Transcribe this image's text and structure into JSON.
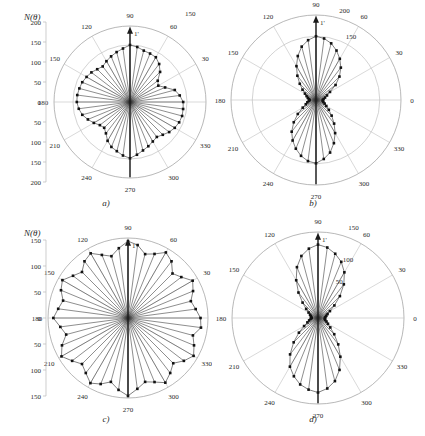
{
  "figure": {
    "background": "#ffffff",
    "panels": [
      {
        "id": "a",
        "caption": "a)",
        "axis_title": "N(θ)",
        "vertical_axis_ticks": [
          "200",
          "150",
          "100",
          "50",
          "0",
          "50",
          "100",
          "150",
          "200"
        ],
        "angle_labels": [
          "0",
          "30",
          "60",
          "90",
          "120",
          "150",
          "180",
          "210",
          "240",
          "270",
          "300",
          "330"
        ],
        "radial_labels": [
          "150"
        ],
        "mean_vector_label": "1'",
        "chart_data": {
          "type": "polar_rose",
          "title": "a)",
          "ylabel": "N(θ)",
          "theta_step_deg": 7.5,
          "rmax": 200,
          "rings": [
            150,
            200
          ],
          "theta": [
            0,
            7.5,
            15,
            22.5,
            30,
            37.5,
            45,
            52.5,
            60,
            67.5,
            75,
            82.5,
            90,
            97.5,
            105,
            112.5,
            120,
            127.5,
            135,
            142.5,
            150,
            157.5,
            165,
            172.5,
            180,
            187.5,
            195,
            202.5,
            210,
            217.5,
            225,
            232.5,
            240,
            247.5,
            255,
            262.5,
            270,
            277.5,
            285,
            292.5,
            300,
            307.5,
            315,
            322.5,
            330,
            337.5,
            345,
            352.5
          ],
          "values": [
            140,
            132,
            122,
            100,
            86,
            92,
            112,
            126,
            136,
            138,
            140,
            146,
            150,
            142,
            136,
            130,
            124,
            118,
            122,
            128,
            132,
            136,
            138,
            140,
            140,
            136,
            130,
            120,
            110,
            100,
            96,
            104,
            118,
            128,
            134,
            142,
            148,
            140,
            132,
            126,
            120,
            116,
            122,
            130,
            136,
            140,
            142,
            141
          ],
          "legend": [],
          "grid": true
        }
      },
      {
        "id": "b",
        "caption": "b)",
        "axis_title": "",
        "vertical_axis_ticks": [],
        "angle_labels": [
          "0",
          "30",
          "60",
          "90",
          "120",
          "150",
          "180",
          "210",
          "240",
          "270",
          "300",
          "330"
        ],
        "radial_labels": [
          "200",
          "150"
        ],
        "mean_vector_label": "1'",
        "chart_data": {
          "type": "polar_rose",
          "title": "b)",
          "ylabel": "N(θ)",
          "theta_step_deg": 7.5,
          "rmax": 200,
          "rings": [
            150,
            200
          ],
          "theta": [
            0,
            7.5,
            15,
            22.5,
            30,
            37.5,
            45,
            52.5,
            60,
            67.5,
            75,
            82.5,
            90,
            97.5,
            105,
            112.5,
            120,
            127.5,
            135,
            142.5,
            150,
            157.5,
            165,
            172.5,
            180,
            187.5,
            195,
            202.5,
            210,
            217.5,
            225,
            232.5,
            240,
            247.5,
            255,
            262.5,
            270,
            277.5,
            285,
            292.5,
            300,
            307.5,
            315,
            322.5,
            330,
            337.5,
            345,
            352.5
          ],
          "values": [
            16,
            18,
            22,
            28,
            38,
            58,
            78,
            96,
            112,
            126,
            138,
            146,
            150,
            142,
            130,
            112,
            92,
            72,
            54,
            40,
            30,
            24,
            20,
            17,
            15,
            17,
            21,
            26,
            36,
            54,
            74,
            94,
            110,
            124,
            136,
            145,
            149,
            140,
            128,
            110,
            90,
            70,
            52,
            38,
            28,
            22,
            18,
            16
          ],
          "legend": [],
          "grid": true
        }
      },
      {
        "id": "c",
        "caption": "c)",
        "axis_title": "N(θ)",
        "vertical_axis_ticks": [
          "150",
          "100",
          "50",
          "0",
          "50",
          "100",
          "150"
        ],
        "angle_labels": [
          "0",
          "30",
          "60",
          "90",
          "120",
          "150",
          "180",
          "210",
          "240",
          "270",
          "300",
          "330"
        ],
        "radial_labels": [],
        "mean_vector_label": "1'",
        "chart_data": {
          "type": "polar_rose",
          "title": "c)",
          "ylabel": "N(θ)",
          "theta_step_deg": 7.5,
          "rmax": 150,
          "rings": [
            150
          ],
          "theta": [
            0,
            7.5,
            15,
            22.5,
            30,
            37.5,
            45,
            52.5,
            60,
            67.5,
            75,
            82.5,
            90,
            97.5,
            105,
            112.5,
            120,
            127.5,
            135,
            142.5,
            150,
            157.5,
            165,
            172.5,
            180,
            187.5,
            195,
            202.5,
            210,
            217.5,
            225,
            232.5,
            240,
            247.5,
            255,
            262.5,
            270,
            277.5,
            285,
            292.5,
            300,
            307.5,
            315,
            322.5,
            330,
            337.5,
            345,
            352.5
          ],
          "values": [
            136,
            128,
            122,
            132,
            140,
            126,
            118,
            134,
            142,
            130,
            124,
            138,
            144,
            132,
            120,
            128,
            140,
            134,
            122,
            130,
            142,
            136,
            126,
            132,
            140,
            128,
            120,
            134,
            144,
            132,
            122,
            130,
            141,
            134,
            124,
            136,
            146,
            134,
            124,
            130,
            140,
            130,
            120,
            132,
            142,
            134,
            126,
            138
          ],
          "legend": [],
          "grid": true
        }
      },
      {
        "id": "d",
        "caption": "d)",
        "axis_title": "",
        "vertical_axis_ticks": [],
        "angle_labels": [
          "0",
          "30",
          "60",
          "90",
          "120",
          "150",
          "180",
          "210",
          "240",
          "270",
          "300",
          "330"
        ],
        "radial_labels": [
          "150",
          "100",
          "50"
        ],
        "mean_vector_label": "1'",
        "chart_data": {
          "type": "polar_rose",
          "title": "d)",
          "ylabel": "N(θ)",
          "theta_step_deg": 7.5,
          "rmax": 150,
          "rings": [
            150
          ],
          "theta": [
            0,
            7.5,
            15,
            22.5,
            30,
            37.5,
            45,
            52.5,
            60,
            67.5,
            75,
            82.5,
            90,
            97.5,
            105,
            112.5,
            120,
            127.5,
            135,
            142.5,
            150,
            157.5,
            165,
            172.5,
            180,
            187.5,
            195,
            202.5,
            210,
            217.5,
            225,
            232.5,
            240,
            247.5,
            255,
            262.5,
            270,
            277.5,
            285,
            292.5,
            300,
            307.5,
            315,
            322.5,
            330,
            337.5,
            345,
            352.5
          ],
          "values": [
            12,
            13,
            15,
            18,
            24,
            36,
            54,
            74,
            92,
            106,
            116,
            124,
            128,
            122,
            112,
            96,
            76,
            56,
            38,
            26,
            19,
            15,
            13,
            12,
            11,
            13,
            16,
            20,
            28,
            42,
            60,
            80,
            98,
            110,
            120,
            126,
            130,
            124,
            114,
            98,
            78,
            58,
            40,
            27,
            20,
            16,
            13,
            12
          ],
          "legend": [],
          "grid": true
        }
      }
    ]
  }
}
